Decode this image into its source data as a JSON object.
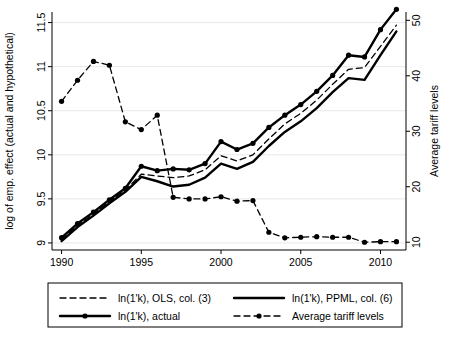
{
  "chart_data": {
    "type": "line",
    "title": "",
    "xlabel": "",
    "ylabel": "log of emp. effect (actual and hypothetical)",
    "ylabel_right": "Average tariff levels",
    "x": [
      1990,
      1991,
      1992,
      1993,
      1994,
      1995,
      1996,
      1997,
      1998,
      1999,
      2000,
      2001,
      2002,
      2003,
      2004,
      2005,
      2006,
      2007,
      2008,
      2009,
      2010,
      2011
    ],
    "xlim": [
      1989.4,
      2011.6
    ],
    "ylim": [
      8.92,
      11.62
    ],
    "ylim_right": [
      8.6,
      51.5
    ],
    "xticks": [
      1990,
      1995,
      2000,
      2005,
      2010
    ],
    "xticklabels": [
      "1990",
      "1995",
      "2000",
      "2005",
      "2010"
    ],
    "yticks": [
      9,
      9.5,
      10,
      10.5,
      11,
      11.5
    ],
    "yticklabels": [
      "9",
      "9.5",
      "10",
      "10.5",
      "11",
      "11.5"
    ],
    "yticks_right": [
      10,
      20,
      30,
      40,
      50
    ],
    "yticklabels_right": [
      "10",
      "20",
      "30",
      "40",
      "50"
    ],
    "grid": "horizontal",
    "legend_position": "below",
    "series": [
      {
        "name": "ln(1'k), OLS, col. (3)",
        "style": "dashed",
        "markers": false,
        "axis": "left",
        "values": [
          9.04,
          9.2,
          9.33,
          9.47,
          9.6,
          9.78,
          9.76,
          9.74,
          9.76,
          9.83,
          9.99,
          9.93,
          10.0,
          10.18,
          10.35,
          10.47,
          10.62,
          10.8,
          10.97,
          10.99,
          11.23,
          11.47
        ]
      },
      {
        "name": "ln(1'k), PPML, col. (6)",
        "style": "solid",
        "markers": false,
        "axis": "left",
        "values": [
          9.02,
          9.18,
          9.31,
          9.45,
          9.58,
          9.75,
          9.7,
          9.64,
          9.66,
          9.74,
          9.9,
          9.84,
          9.92,
          10.1,
          10.26,
          10.38,
          10.53,
          10.71,
          10.87,
          10.85,
          11.13,
          11.4
        ]
      },
      {
        "name": "ln(1'k), actual",
        "style": "solid-markers",
        "markers": true,
        "axis": "left",
        "values": [
          9.06,
          9.22,
          9.35,
          9.49,
          9.62,
          9.87,
          9.82,
          9.84,
          9.83,
          9.9,
          10.15,
          10.06,
          10.13,
          10.31,
          10.45,
          10.57,
          10.72,
          10.9,
          11.13,
          11.11,
          11.42,
          11.65
        ]
      },
      {
        "name": "Average tariff levels",
        "style": "dashed-markers",
        "markers": true,
        "axis": "right",
        "values": [
          35.4,
          39.2,
          42.6,
          41.9,
          31.7,
          30.3,
          32.9,
          18.1,
          17.8,
          17.8,
          18.2,
          17.4,
          17.5,
          11.8,
          10.8,
          10.9,
          11.0,
          10.9,
          10.9,
          10.0,
          10.1,
          10.1
        ]
      }
    ],
    "legend": [
      {
        "label": "ln(1'k), OLS, col. (3)",
        "style": "dashed"
      },
      {
        "label": "ln(1'k), PPML, col. (6)",
        "style": "solid"
      },
      {
        "label": "ln(1'k), actual",
        "style": "solid-markers"
      },
      {
        "label": "Average tariff levels",
        "style": "dashed-markers"
      }
    ],
    "colors": {
      "line": "#000000",
      "grid": "#e8e8e8",
      "axis": "#000000",
      "background": "#ffffff"
    }
  }
}
